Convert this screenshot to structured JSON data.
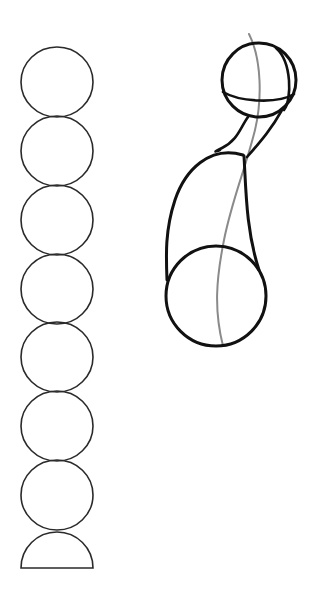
{
  "drawing": {
    "title": "Pencil sketch: stack of circles and arm/limb construction",
    "background": "#ffffff",
    "ink_color": "#1a1a1a",
    "guide_color": "#8a8a8a",
    "circle_stack": {
      "center_x": 57,
      "radius": 36,
      "centers_y": [
        82,
        151,
        220,
        289,
        357,
        426,
        495
      ],
      "half_circle": {
        "center_y": 568,
        "radius": 36
      }
    },
    "figure": {
      "head_sphere": {
        "cx": 259,
        "cy": 80,
        "r": 37
      },
      "base_sphere": {
        "cx": 216,
        "cy": 296,
        "r": 50
      }
    }
  }
}
